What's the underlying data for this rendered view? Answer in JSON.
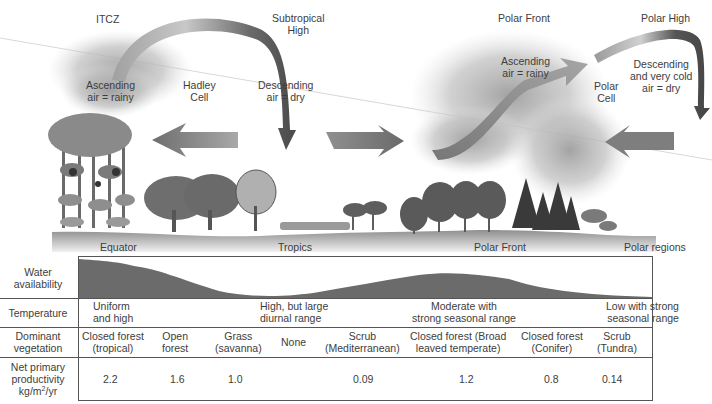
{
  "diagram": {
    "type": "atmospheric circulation cells and biome vegetation gradient",
    "top_labels": {
      "itcz": "ITCZ",
      "subtropical_high": [
        "Subtropical",
        "High"
      ],
      "polar_front": "Polar Front",
      "polar_high": "Polar High"
    },
    "cell_labels": {
      "hadley_ascending": [
        "Ascending",
        "air = rainy"
      ],
      "hadley_cell": [
        "Hadley",
        "Cell"
      ],
      "hadley_descending": [
        "Descending",
        "air = dry"
      ],
      "polar_ascending": [
        "Ascending",
        "air = rainy"
      ],
      "polar_cell": [
        "Polar",
        "Cell"
      ],
      "polar_descending": [
        "Descending",
        "and very cold",
        "air = dry"
      ]
    },
    "ground_labels": {
      "equator": "Equator",
      "tropics": "Tropics",
      "polar_front": "Polar Front",
      "polar_regions": "Polar regions"
    },
    "colors": {
      "arrow_gray": "#7a7a7a",
      "arrow_dark": "#4a4a4a",
      "cloud": "#bdbdbd",
      "ground": "#9a9a9a",
      "water_fill": "#6b6b6b",
      "line": "#555555",
      "text": "#3d3d3d"
    }
  },
  "table": {
    "row_headers": {
      "water": [
        "Water",
        "availability"
      ],
      "temperature": "Temperature",
      "vegetation": [
        "Dominant",
        "vegetation"
      ],
      "npp": [
        "Net primary",
        "productivity",
        "kg/m",
        "2",
        "/yr"
      ]
    },
    "temperature": [
      [
        "Uniform",
        "and high"
      ],
      [
        "High, but large",
        "diurnal range"
      ],
      [
        "Moderate with",
        "strong seasonal range"
      ],
      [
        "Low with strong",
        "seasonal range"
      ]
    ],
    "vegetation": [
      [
        "Closed forest",
        "(tropical)"
      ],
      [
        "Open",
        "forest"
      ],
      [
        "Grass",
        "(savanna)"
      ],
      [
        "None"
      ],
      [
        "Scrub",
        "(Mediterranean)"
      ],
      [
        "Closed forest (Broad",
        "leaved temperate)"
      ],
      [
        "Closed forest",
        "(Conifer)"
      ],
      [
        "Scrub",
        "(Tundra)"
      ]
    ],
    "npp": [
      "2.2",
      "1.6",
      "1.0",
      "",
      "0.09",
      "1.2",
      "0.8",
      "0.14"
    ]
  }
}
